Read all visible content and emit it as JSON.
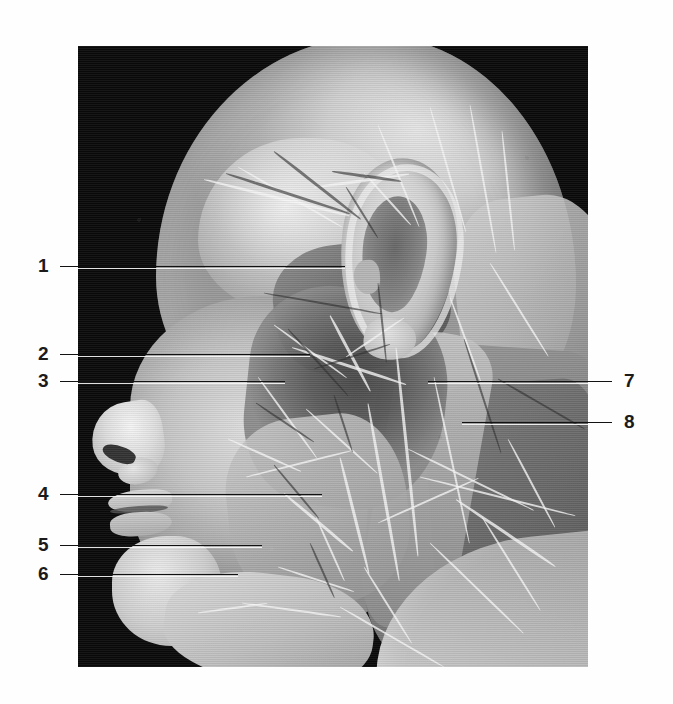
{
  "figure": {
    "kind": "anatomical-dissection-photograph",
    "view": "left lateral head and neck",
    "background_color": "#ffffff",
    "photo_background_color": "#0a0a0a",
    "photo": {
      "x": 78,
      "y": 46,
      "width": 510,
      "height": 621
    }
  },
  "callouts": {
    "left": [
      {
        "number": "1",
        "num_x": 38,
        "num_y": 256,
        "line_y": 266,
        "line_x1": 60,
        "line_x2": 345
      },
      {
        "number": "2",
        "num_x": 38,
        "num_y": 344,
        "line_y": 354,
        "line_x1": 60,
        "line_x2": 310
      },
      {
        "number": "3",
        "num_x": 38,
        "num_y": 371,
        "line_y": 381,
        "line_x1": 60,
        "line_x2": 285
      },
      {
        "number": "4",
        "num_x": 38,
        "num_y": 484,
        "line_y": 494,
        "line_x1": 60,
        "line_x2": 322
      },
      {
        "number": "5",
        "num_x": 38,
        "num_y": 535,
        "line_y": 545,
        "line_x1": 60,
        "line_x2": 262
      },
      {
        "number": "6",
        "num_x": 38,
        "num_y": 564,
        "line_y": 574,
        "line_x1": 60,
        "line_x2": 238
      }
    ],
    "right": [
      {
        "number": "7",
        "num_x": 624,
        "num_y": 371,
        "line_y": 381,
        "line_x1": 428,
        "line_x2": 612
      },
      {
        "number": "8",
        "num_x": 624,
        "num_y": 412,
        "line_y": 422,
        "line_x1": 462,
        "line_x2": 612
      }
    ]
  },
  "strands": {
    "light": [
      {
        "x": 126,
        "y": 132,
        "w": 150,
        "a": 14,
        "t": 3
      },
      {
        "x": 160,
        "y": 120,
        "w": 120,
        "a": 30,
        "t": 2
      },
      {
        "x": 236,
        "y": 140,
        "w": 96,
        "a": -8,
        "t": 3
      },
      {
        "x": 286,
        "y": 126,
        "w": 70,
        "a": 48,
        "t": 2
      },
      {
        "x": 300,
        "y": 78,
        "w": 110,
        "a": 68,
        "t": 2
      },
      {
        "x": 352,
        "y": 60,
        "w": 130,
        "a": 74,
        "t": 2
      },
      {
        "x": 392,
        "y": 58,
        "w": 150,
        "a": 80,
        "t": 2
      },
      {
        "x": 424,
        "y": 84,
        "w": 120,
        "a": 84,
        "t": 2
      },
      {
        "x": 196,
        "y": 278,
        "w": 90,
        "a": 36,
        "t": 2
      },
      {
        "x": 214,
        "y": 300,
        "w": 120,
        "a": 18,
        "t": 3
      },
      {
        "x": 180,
        "y": 330,
        "w": 100,
        "a": 54,
        "t": 2
      },
      {
        "x": 252,
        "y": 268,
        "w": 86,
        "a": 62,
        "t": 3
      },
      {
        "x": 268,
        "y": 310,
        "w": 70,
        "a": -34,
        "t": 2
      },
      {
        "x": 228,
        "y": 362,
        "w": 96,
        "a": 42,
        "t": 2
      },
      {
        "x": 150,
        "y": 392,
        "w": 80,
        "a": 24,
        "t": 2
      },
      {
        "x": 168,
        "y": 430,
        "w": 110,
        "a": -14,
        "t": 2
      },
      {
        "x": 206,
        "y": 446,
        "w": 90,
        "a": 40,
        "t": 3
      },
      {
        "x": 238,
        "y": 470,
        "w": 70,
        "a": 66,
        "t": 2
      },
      {
        "x": 262,
        "y": 410,
        "w": 120,
        "a": 76,
        "t": 3
      },
      {
        "x": 290,
        "y": 356,
        "w": 180,
        "a": 80,
        "t": 3
      },
      {
        "x": 318,
        "y": 300,
        "w": 210,
        "a": 84,
        "t": 3
      },
      {
        "x": 356,
        "y": 330,
        "w": 170,
        "a": 78,
        "t": 2
      },
      {
        "x": 330,
        "y": 402,
        "w": 140,
        "a": 26,
        "t": 2
      },
      {
        "x": 342,
        "y": 430,
        "w": 160,
        "a": 14,
        "t": 2
      },
      {
        "x": 378,
        "y": 452,
        "w": 120,
        "a": 34,
        "t": 3
      },
      {
        "x": 300,
        "y": 476,
        "w": 110,
        "a": -24,
        "t": 2
      },
      {
        "x": 352,
        "y": 496,
        "w": 130,
        "a": 44,
        "t": 2
      },
      {
        "x": 404,
        "y": 470,
        "w": 110,
        "a": 58,
        "t": 2
      },
      {
        "x": 430,
        "y": 392,
        "w": 100,
        "a": 62,
        "t": 2
      },
      {
        "x": 286,
        "y": 520,
        "w": 90,
        "a": 58,
        "t": 2
      },
      {
        "x": 200,
        "y": 520,
        "w": 80,
        "a": 18,
        "t": 2
      },
      {
        "x": 164,
        "y": 556,
        "w": 100,
        "a": 8,
        "t": 2
      },
      {
        "x": 120,
        "y": 566,
        "w": 70,
        "a": -8,
        "t": 2
      },
      {
        "x": 262,
        "y": 560,
        "w": 120,
        "a": 30,
        "t": 2
      },
      {
        "x": 372,
        "y": 250,
        "w": 90,
        "a": 70,
        "t": 2
      },
      {
        "x": 412,
        "y": 216,
        "w": 110,
        "a": 58,
        "t": 2
      }
    ],
    "dark": [
      {
        "x": 148,
        "y": 126,
        "w": 130,
        "a": 18,
        "t": 3
      },
      {
        "x": 196,
        "y": 104,
        "w": 110,
        "a": 38,
        "t": 3
      },
      {
        "x": 254,
        "y": 124,
        "w": 70,
        "a": 8,
        "t": 3
      },
      {
        "x": 268,
        "y": 140,
        "w": 60,
        "a": 58,
        "t": 2
      },
      {
        "x": 186,
        "y": 246,
        "w": 120,
        "a": 10,
        "t": 2
      },
      {
        "x": 210,
        "y": 282,
        "w": 90,
        "a": 48,
        "t": 2
      },
      {
        "x": 236,
        "y": 322,
        "w": 80,
        "a": -18,
        "t": 2
      },
      {
        "x": 178,
        "y": 356,
        "w": 70,
        "a": 34,
        "t": 2
      },
      {
        "x": 256,
        "y": 348,
        "w": 60,
        "a": 72,
        "t": 2
      },
      {
        "x": 300,
        "y": 236,
        "w": 80,
        "a": 84,
        "t": 2
      },
      {
        "x": 386,
        "y": 292,
        "w": 120,
        "a": 72,
        "t": 2
      },
      {
        "x": 420,
        "y": 332,
        "w": 100,
        "a": 30,
        "t": 2
      },
      {
        "x": 196,
        "y": 418,
        "w": 70,
        "a": 50,
        "t": 2
      },
      {
        "x": 232,
        "y": 496,
        "w": 60,
        "a": 66,
        "t": 2
      }
    ]
  }
}
